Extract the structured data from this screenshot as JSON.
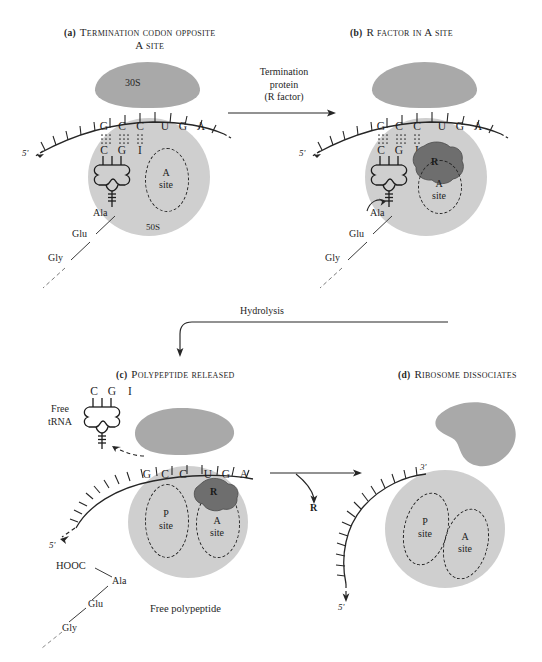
{
  "figure": {
    "background_color": "#ffffff",
    "colors": {
      "small_subunit": "#a9a9a9",
      "large_subunit": "#cfcfcf",
      "r_factor": "#6e6e6e",
      "ink": "#262626"
    }
  },
  "panels": [
    {
      "id": "a",
      "label": "(a)",
      "title_line1": "Termination codon opposite",
      "title_line2": "A site",
      "subunit_small_label": "30S",
      "subunit_large_label": "50S",
      "mrna_five_prime": "5'",
      "codon_bases": [
        "G",
        "C",
        "C",
        "U",
        "G",
        "A"
      ],
      "anticodon_bases": [
        "C",
        "G",
        "I"
      ],
      "a_site_line1": "A",
      "a_site_line2": "site",
      "peptide_residues": [
        "Ala",
        "Glu",
        "Gly"
      ]
    },
    {
      "id": "b",
      "label": "(b)",
      "title_line1": "R factor in A site",
      "title_line2": "",
      "r_factor_label": "R",
      "mrna_five_prime": "5'",
      "codon_bases": [
        "G",
        "C",
        "C",
        "U",
        "G",
        "A"
      ],
      "anticodon_bases": [
        "C",
        "G",
        "I"
      ],
      "a_site_line1": "A",
      "a_site_line2": "site",
      "peptide_residues": [
        "Ala",
        "Glu",
        "Gly"
      ]
    },
    {
      "id": "c",
      "label": "(c)",
      "title_line1": "Polypeptide released",
      "title_line2": "",
      "free_trna_line1": "Free",
      "free_trna_line2": "tRNA",
      "free_trna_bases": [
        "C",
        "G",
        "I"
      ],
      "mrna_five_prime": "5'",
      "codon_bases": [
        "G",
        "C",
        "C",
        "U",
        "G",
        "A"
      ],
      "p_site_line1": "P",
      "p_site_line2": "site",
      "a_site_line1": "A",
      "a_site_line2": "site",
      "r_factor_label": "R",
      "polypeptide_terminus": "HOOC",
      "polypeptide_residues": [
        "Ala",
        "Glu",
        "Gly"
      ],
      "polypeptide_caption": "Free polypeptide"
    },
    {
      "id": "d",
      "label": "(d)",
      "title_line1": "Ribosome dissociates",
      "title_line2": "",
      "mrna_three_prime": "3'",
      "mrna_five_prime": "5'",
      "p_site_line1": "P",
      "p_site_line2": "site",
      "a_site_line1": "A",
      "a_site_line2": "site"
    }
  ],
  "arrows": [
    {
      "id": "a-to-b",
      "label_line1": "Termination",
      "label_line2": "protein",
      "label_line3": "(R factor)"
    },
    {
      "id": "b-to-c",
      "label_line1": "Hydrolysis"
    },
    {
      "id": "c-to-d",
      "label_line1": "R"
    }
  ]
}
